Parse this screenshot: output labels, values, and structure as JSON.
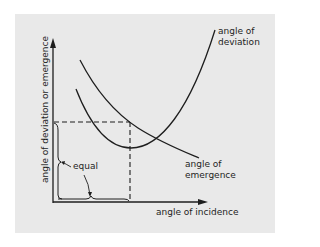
{
  "diagram": {
    "title": "",
    "y_axis_label": "angle of deviation or emergence",
    "x_axis_label": "angle of incidence",
    "curves": [
      {
        "name": "deviation",
        "label_line1": "angle of",
        "label_line2": "deviation"
      },
      {
        "name": "emergence",
        "label_line1": "angle of",
        "label_line2": "emergence"
      }
    ],
    "annotation": "equal",
    "colors": {
      "background": "#e9e9e9",
      "ink": "#1e1e1e"
    }
  }
}
